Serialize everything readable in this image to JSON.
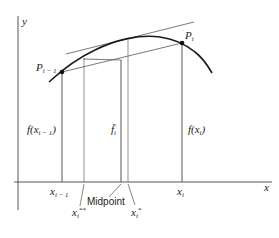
{
  "diagram": {
    "axes": {
      "x_label": "x",
      "y_label": "y"
    },
    "points": [
      {
        "name": "P",
        "subscript": "i − 1"
      },
      {
        "name": "P",
        "subscript": "i"
      }
    ],
    "heights": {
      "left": {
        "text": "f(x",
        "sub": "i − 1",
        "close": ")"
      },
      "mean": {
        "text": "f̄",
        "sub": "i"
      },
      "right": {
        "text": "f(x",
        "sub": "i",
        "close": ")"
      }
    },
    "x_ticks": {
      "left": {
        "text": "x",
        "sub": "i − 1"
      },
      "right": {
        "text": "x",
        "sub": "i"
      }
    },
    "annotations": {
      "x_double_star": {
        "text": "x",
        "sub": "i",
        "sup": "**"
      },
      "midpoint": "Midpoint",
      "x_star": {
        "text": "x",
        "sub": "i",
        "sup": "*"
      }
    },
    "colors": {
      "curve": "#1a1a1a",
      "lines": "#555555",
      "axes": "#444444"
    }
  }
}
